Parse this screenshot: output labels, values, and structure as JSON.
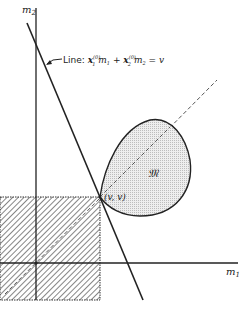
{
  "diagram": {
    "axes": {
      "x_label": "m",
      "x_label_sub": "1",
      "y_label": "m",
      "y_label_sub": "2"
    },
    "line_label": {
      "prefix": "Line: ",
      "term1_var": "x",
      "term1_sub": "1",
      "term1_sup": "(0)",
      "term1_m": "m",
      "term1_m_sub": "1",
      "plus": " + ",
      "term2_var": "x",
      "term2_sub": "2",
      "term2_sup": "(0)",
      "term2_m": "m",
      "term2_m_sub": "2",
      "equals": " = ",
      "rhs": "v"
    },
    "set_label": "𝔐",
    "point_label": "(v, v)",
    "colors": {
      "stroke": "#222222",
      "set_fill": "#e6e6e6",
      "hatch": "#444444",
      "dash": "#555555"
    }
  }
}
